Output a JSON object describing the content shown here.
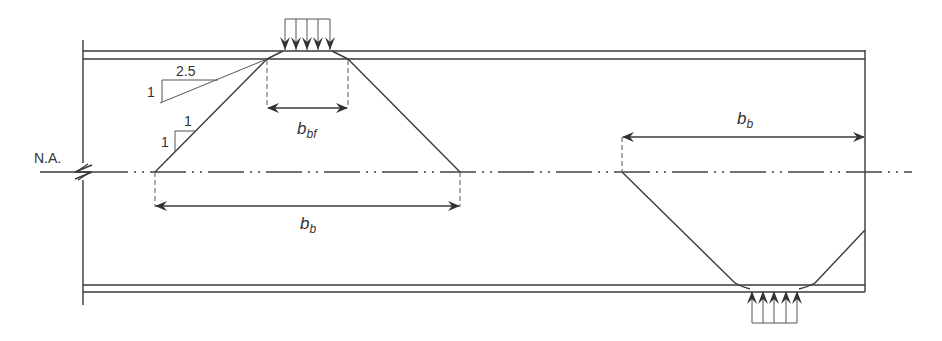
{
  "diagram": {
    "type": "beam load dispersion schematic",
    "neutral_axis_label": "N.A.",
    "top_load": {
      "description": "concentrated load applied downward on top flange",
      "arrow_count": 5,
      "bearing_width_label_main": "b",
      "bearing_width_label_sub": "bf"
    },
    "top_dispersion_width": {
      "label_main": "b",
      "label_sub": "b"
    },
    "bottom_dispersion_width": {
      "label_main": "b",
      "label_sub": "b"
    },
    "bottom_load": {
      "description": "concentrated reaction applied upward on bottom flange",
      "arrow_count": 5
    },
    "slopes": [
      {
        "name": "flange dispersion slope",
        "rise": "1",
        "run": "2.5"
      },
      {
        "name": "web dispersion slope",
        "rise": "1",
        "run": "1"
      }
    ],
    "colors": {
      "line": "#3a3a3a",
      "background": "#ffffff"
    }
  }
}
